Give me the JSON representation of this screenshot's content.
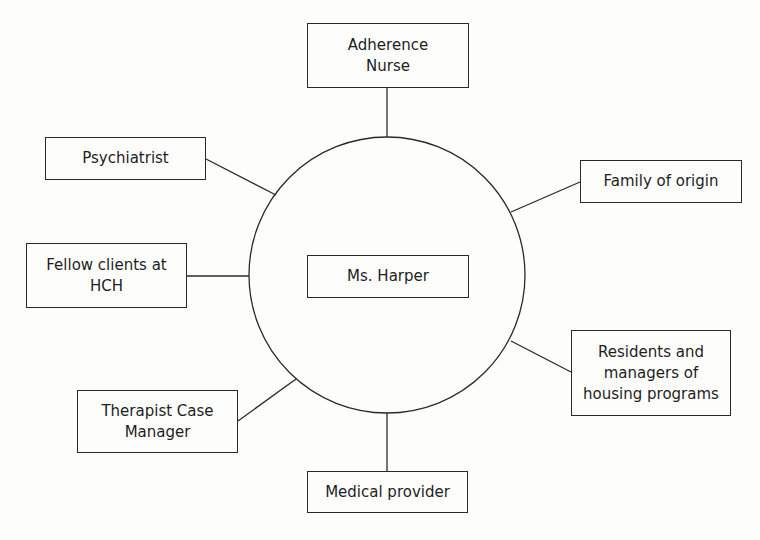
{
  "diagram": {
    "type": "ecomap",
    "center": {
      "label": "Ms. Harper"
    },
    "nodes": [
      {
        "id": "adherence-nurse",
        "label": "Adherence Nurse",
        "lines": [
          "Adherence",
          "Nurse"
        ]
      },
      {
        "id": "family-of-origin",
        "label": "Family of origin",
        "lines": [
          "Family of origin"
        ]
      },
      {
        "id": "residents-managers",
        "label": "Residents and managers of housing programs",
        "lines": [
          "Residents and",
          "managers of",
          "housing programs"
        ]
      },
      {
        "id": "medical-provider",
        "label": "Medical provider",
        "lines": [
          "Medical provider"
        ]
      },
      {
        "id": "therapist-case-manager",
        "label": "Therapist Case Manager",
        "lines": [
          "Therapist Case",
          "Manager"
        ]
      },
      {
        "id": "fellow-clients",
        "label": "Fellow clients at HCH",
        "lines": [
          "Fellow clients at",
          "HCH"
        ]
      },
      {
        "id": "psychiatrist",
        "label": "Psychiatrist",
        "lines": [
          "Psychiatrist"
        ]
      }
    ],
    "edges": [
      [
        "Ms. Harper",
        "Adherence Nurse"
      ],
      [
        "Ms. Harper",
        "Family of origin"
      ],
      [
        "Ms. Harper",
        "Residents and managers of housing programs"
      ],
      [
        "Ms. Harper",
        "Medical provider"
      ],
      [
        "Ms. Harper",
        "Therapist Case Manager"
      ],
      [
        "Ms. Harper",
        "Fellow clients at HCH"
      ],
      [
        "Ms. Harper",
        "Psychiatrist"
      ]
    ],
    "colors": {
      "stroke": "#2a2a2a",
      "text": "#1e1e1e",
      "background": "#fdfdfc"
    }
  }
}
